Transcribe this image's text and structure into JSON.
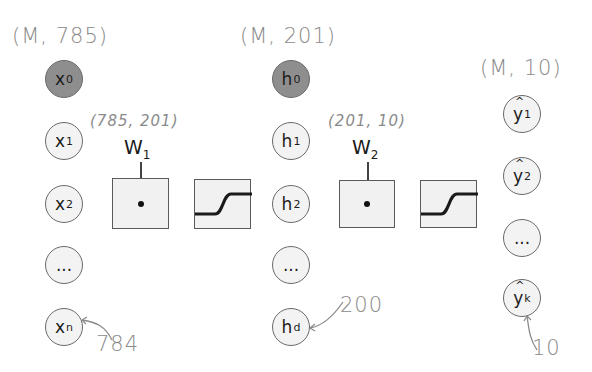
{
  "layers": {
    "input": {
      "shape_label": "(M, 785)",
      "nodes": [
        {
          "base": "x",
          "sub": "0",
          "bias": true
        },
        {
          "base": "x",
          "sub": "1",
          "bias": false
        },
        {
          "base": "x",
          "sub": "2",
          "bias": false
        },
        {
          "base": "...",
          "sub": "",
          "bias": false
        },
        {
          "base": "x",
          "sub": "n",
          "bias": false
        }
      ],
      "last_annotation": "784"
    },
    "hidden": {
      "shape_label": "(M, 201)",
      "nodes": [
        {
          "base": "h",
          "sub": "0",
          "bias": true
        },
        {
          "base": "h",
          "sub": "1",
          "bias": false
        },
        {
          "base": "h",
          "sub": "2",
          "bias": false
        },
        {
          "base": "...",
          "sub": "",
          "bias": false
        },
        {
          "base": "h",
          "sub": "d",
          "bias": false
        }
      ],
      "last_annotation": "200"
    },
    "output": {
      "shape_label": "(M, 10)",
      "nodes": [
        {
          "base": "y",
          "sub": "1",
          "hat": true
        },
        {
          "base": "y",
          "sub": "2",
          "hat": true
        },
        {
          "base": "...",
          "sub": "",
          "hat": false
        },
        {
          "base": "y",
          "sub": "k",
          "hat": true
        }
      ],
      "last_annotation": "10"
    }
  },
  "weights": [
    {
      "label": "W",
      "sub": "1",
      "shape_label": "(785, 201)",
      "op_symbol": "dot-product",
      "activation": "sigmoid"
    },
    {
      "label": "W",
      "sub": "2",
      "shape_label": "(201, 10)",
      "op_symbol": "dot-product",
      "activation": "sigmoid"
    }
  ],
  "colors": {
    "bias_node": "#8e8e8e",
    "node_fill": "#f3f3f3",
    "box_fill": "#f1f1f1",
    "annotation": "#8a8a8a"
  }
}
